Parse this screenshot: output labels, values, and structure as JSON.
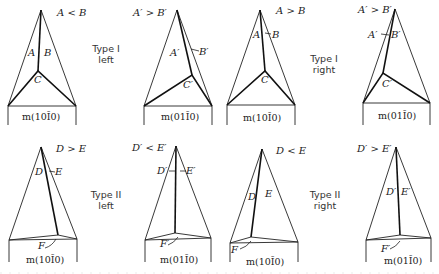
{
  "figure": {
    "rows": [
      {
        "row": "Type I",
        "panels": [
          {
            "relation": "A < B",
            "face_left": "A",
            "face_right": "B",
            "face_bottom": "C",
            "prism": "m(10Ī0)"
          },
          {
            "relation": "A′ > B′",
            "face_left": "A′",
            "face_right": "B′",
            "face_bottom": "C′",
            "prism": "m(01Ī0)"
          },
          {
            "relation": "A > B",
            "face_left": "A",
            "face_right": "B",
            "face_bottom": "C",
            "prism": "m(10Ī0)"
          },
          {
            "relation": "A′ > B′",
            "face_left": "A′",
            "face_right": "B′",
            "face_bottom": "C′",
            "prism": "m(01Ī0)"
          }
        ],
        "type_labels": [
          {
            "line1": "Type I",
            "line2": "left"
          },
          {
            "line1": "Type I",
            "line2": "right"
          }
        ]
      },
      {
        "row": "Type II",
        "panels": [
          {
            "relation": "D > E",
            "face_left": "D",
            "face_right": "E",
            "face_bottom": "F",
            "prism": "m(10Ī0)"
          },
          {
            "relation": "D′ < E′",
            "face_left": "D′",
            "face_right": "E′",
            "face_bottom": "F′",
            "prism": "m(01Ī0)"
          },
          {
            "relation": "D < E",
            "face_left": "D",
            "face_right": "E",
            "face_bottom": "F",
            "prism": "m(10Ī0)"
          },
          {
            "relation": "D′ > E′",
            "face_left": "D′",
            "face_right": "E′",
            "face_bottom": "F′",
            "prism": "m(01Ī0)"
          }
        ],
        "type_labels": [
          {
            "line1": "Type II",
            "line2": "left"
          },
          {
            "line1": "Type II",
            "line2": "right"
          }
        ]
      }
    ]
  }
}
